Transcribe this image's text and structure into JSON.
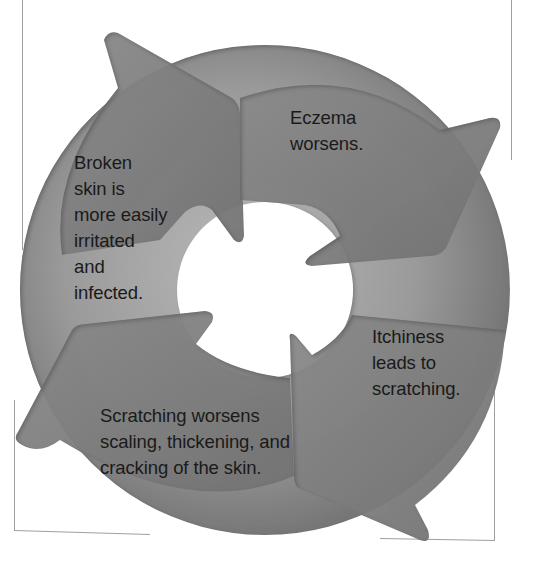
{
  "diagram": {
    "type": "cycle",
    "title": "",
    "colors": {
      "ring": "#8c8c8c",
      "ring_light": "#b4b4b4",
      "arrow": "#7e7e7e",
      "frame": "#9a9a9a",
      "text": "#1a1a1a"
    },
    "steps": [
      {
        "id": "step-1",
        "text": "Eczema\nworsens."
      },
      {
        "id": "step-2",
        "text": "Itchiness\nleads to\nscratching."
      },
      {
        "id": "step-3",
        "text": "Scratching worsens\nscaling, thickening, and\ncracking of the skin."
      },
      {
        "id": "step-4",
        "text": "Broken\nskin is\nmore easily\nirritated\nand\ninfected."
      }
    ],
    "flow": "clockwise"
  }
}
